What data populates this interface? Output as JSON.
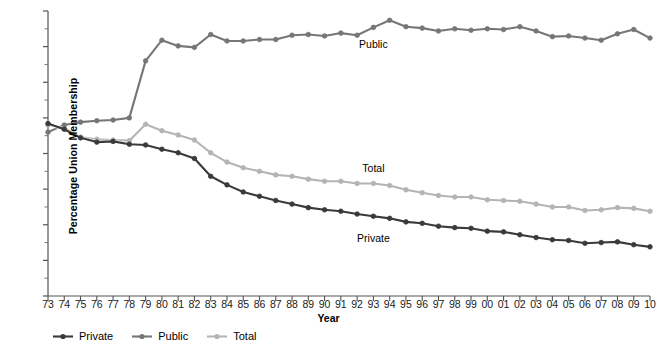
{
  "chart_data": {
    "type": "line",
    "title": "",
    "xlabel": "Year",
    "ylabel": "Percentage Union Membership",
    "ylim": [
      0,
      40
    ],
    "ytick_values": [
      0,
      5,
      10,
      15,
      20,
      25,
      30,
      35,
      40
    ],
    "ytick_labels": [
      "0",
      "5",
      "10",
      "15",
      "20",
      "25",
      "30",
      "35",
      "40%"
    ],
    "yminor_step": 2.5,
    "grid": false,
    "legend_position": "bottom-left",
    "marker": "circle",
    "x": [
      1973,
      1974,
      1975,
      1976,
      1977,
      1978,
      1979,
      1980,
      1981,
      1982,
      1983,
      1984,
      1985,
      1986,
      1987,
      1988,
      1989,
      1990,
      1991,
      1992,
      1993,
      1994,
      1995,
      1996,
      1997,
      1998,
      1999,
      2000,
      2001,
      2002,
      2003,
      2004,
      2005,
      2006,
      2007,
      2008,
      2009,
      2010
    ],
    "categories": [
      "73",
      "74",
      "75",
      "76",
      "77",
      "78",
      "79",
      "80",
      "81",
      "82",
      "83",
      "84",
      "85",
      "86",
      "87",
      "88",
      "89",
      "90",
      "91",
      "92",
      "93",
      "94",
      "95",
      "96",
      "97",
      "98",
      "99",
      "00",
      "01",
      "02",
      "03",
      "04",
      "05",
      "06",
      "07",
      "08",
      "09",
      "10"
    ],
    "series": [
      {
        "name": "Private",
        "color": "#3a3a3a",
        "values": [
          24.2,
          23.4,
          22.2,
          21.6,
          21.7,
          21.3,
          21.2,
          20.6,
          20.1,
          19.3,
          16.8,
          15.6,
          14.6,
          14.0,
          13.4,
          12.9,
          12.4,
          12.1,
          11.9,
          11.5,
          11.2,
          10.9,
          10.4,
          10.2,
          9.8,
          9.6,
          9.5,
          9.1,
          9.0,
          8.6,
          8.2,
          7.9,
          7.8,
          7.4,
          7.5,
          7.6,
          7.2,
          6.9
        ],
        "label_x": 1996,
        "label_y": 6.5
      },
      {
        "name": "Public",
        "color": "#767676",
        "values": [
          23.0,
          24.0,
          24.4,
          24.6,
          24.7,
          25.0,
          33.0,
          35.9,
          35.1,
          34.9,
          36.7,
          35.8,
          35.8,
          36.0,
          36.0,
          36.6,
          36.7,
          36.5,
          36.9,
          36.6,
          37.7,
          38.7,
          37.8,
          37.6,
          37.2,
          37.5,
          37.3,
          37.5,
          37.4,
          37.8,
          37.2,
          36.4,
          36.5,
          36.2,
          35.9,
          36.8,
          37.4,
          36.2
        ],
        "label_x": 1992,
        "label_y": 35.6
      },
      {
        "name": "Total",
        "color": "#b4b4b4",
        "values": [
          24.0,
          23.6,
          22.3,
          22.0,
          21.9,
          21.8,
          24.1,
          23.2,
          22.6,
          21.9,
          20.1,
          18.8,
          18.0,
          17.5,
          17.0,
          16.8,
          16.4,
          16.1,
          16.1,
          15.8,
          15.8,
          15.5,
          14.9,
          14.5,
          14.1,
          13.9,
          13.9,
          13.5,
          13.4,
          13.3,
          12.9,
          12.5,
          12.5,
          12.0,
          12.1,
          12.4,
          12.3,
          11.9
        ],
        "label_x": 1993,
        "label_y": 17.8
      }
    ],
    "annotations": [
      {
        "text": "Public",
        "x": 1993,
        "y": 35.4
      },
      {
        "text": "Total",
        "x": 1993,
        "y": 18.0
      },
      {
        "text": "Private",
        "x": 1993,
        "y": 8.2
      }
    ],
    "legend": [
      {
        "label": "Private",
        "color": "#3a3a3a"
      },
      {
        "label": "Public",
        "color": "#767676"
      },
      {
        "label": "Total",
        "color": "#b4b4b4"
      }
    ]
  }
}
